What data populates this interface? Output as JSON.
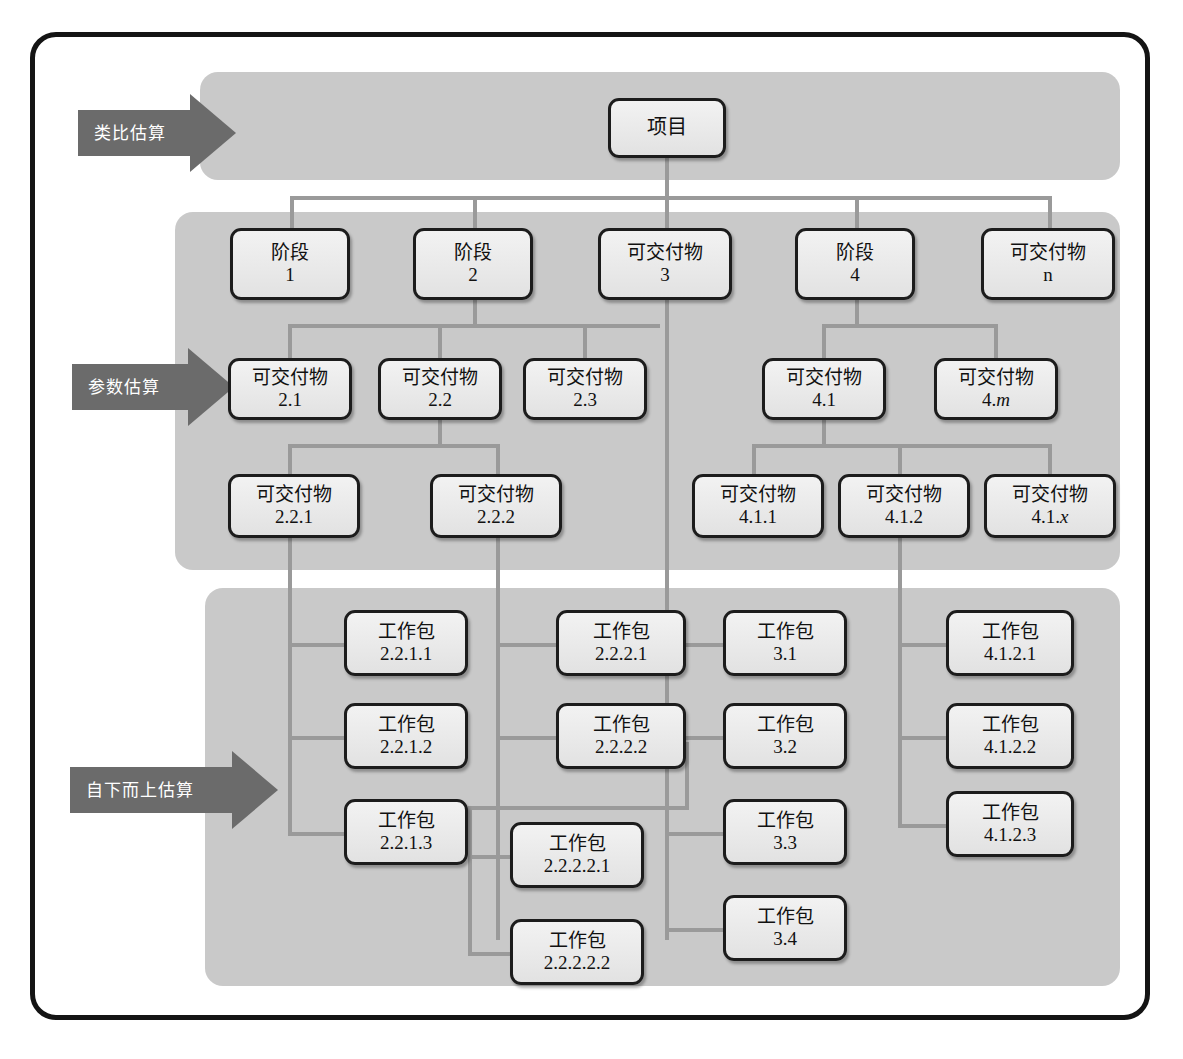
{
  "diagram": {
    "labels": {
      "phase": "阶段",
      "deliverable": "可交付物",
      "work_package": "工作包",
      "project": "项目"
    },
    "colors": {
      "band": "#c9c9c9",
      "arrow": "#6b6b6b",
      "connector": "#9a9a9a",
      "node_border": "#1c1c1c",
      "frame": "#141414"
    }
  },
  "arrows": [
    {
      "id": "analogous",
      "label": "类比估算"
    },
    {
      "id": "parametric",
      "label": "参数估算"
    },
    {
      "id": "bottom_up",
      "label": "自下而上估算"
    }
  ],
  "nodes": {
    "root": {
      "line1": "项目",
      "line2": ""
    },
    "l1_1": {
      "line1": "阶段",
      "line2": "1"
    },
    "l1_2": {
      "line1": "阶段",
      "line2": "2"
    },
    "l1_3": {
      "line1": "可交付物",
      "line2": "3"
    },
    "l1_4": {
      "line1": "阶段",
      "line2": "4"
    },
    "l1_n": {
      "line1": "可交付物",
      "line2": "n",
      "italic": true
    },
    "l2_21": {
      "line1": "可交付物",
      "line2": "2.1"
    },
    "l2_22": {
      "line1": "可交付物",
      "line2": "2.2"
    },
    "l2_23": {
      "line1": "可交付物",
      "line2": "2.3"
    },
    "l2_41": {
      "line1": "可交付物",
      "line2": "4.1"
    },
    "l2_4m": {
      "line1": "可交付物",
      "line2": "4.m",
      "italic_tail": "m"
    },
    "l3_221": {
      "line1": "可交付物",
      "line2": "2.2.1"
    },
    "l3_222": {
      "line1": "可交付物",
      "line2": "2.2.2"
    },
    "l3_411": {
      "line1": "可交付物",
      "line2": "4.1.1"
    },
    "l3_412": {
      "line1": "可交付物",
      "line2": "4.1.2"
    },
    "l3_41x": {
      "line1": "可交付物",
      "line2": "4.1.x",
      "italic_tail": "x"
    },
    "wp_2211": {
      "line1": "工作包",
      "line2": "2.2.1.1"
    },
    "wp_2212": {
      "line1": "工作包",
      "line2": "2.2.1.2"
    },
    "wp_2213": {
      "line1": "工作包",
      "line2": "2.2.1.3"
    },
    "wp_2221": {
      "line1": "工作包",
      "line2": "2.2.2.1"
    },
    "wp_2222": {
      "line1": "工作包",
      "line2": "2.2.2.2"
    },
    "wp_22221": {
      "line1": "工作包",
      "line2": "2.2.2.2.1"
    },
    "wp_22222": {
      "line1": "工作包",
      "line2": "2.2.2.2.2"
    },
    "wp_31": {
      "line1": "工作包",
      "line2": "3.1"
    },
    "wp_32": {
      "line1": "工作包",
      "line2": "3.2"
    },
    "wp_33": {
      "line1": "工作包",
      "line2": "3.3"
    },
    "wp_34": {
      "line1": "工作包",
      "line2": "3.4"
    },
    "wp_4121": {
      "line1": "工作包",
      "line2": "4.1.2.1"
    },
    "wp_4122": {
      "line1": "工作包",
      "line2": "4.1.2.2"
    },
    "wp_4123": {
      "line1": "工作包",
      "line2": "4.1.2.3"
    }
  }
}
